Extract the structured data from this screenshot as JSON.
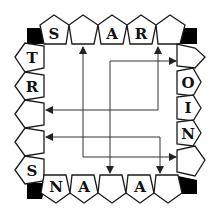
{
  "diagram": {
    "colors": {
      "stroke": "#1a1a1a",
      "corner_fill": "#000000",
      "arrow": "#222222",
      "background": "#ffffff"
    },
    "top_row": [
      {
        "letter": "S"
      },
      {
        "letter": ""
      },
      {
        "letter": "A"
      },
      {
        "letter": "R"
      },
      {
        "letter": ""
      }
    ],
    "left_column": [
      {
        "letter": "T"
      },
      {
        "letter": "R"
      },
      {
        "letter": ""
      },
      {
        "letter": ""
      },
      {
        "letter": "S"
      }
    ],
    "right_column": [
      {
        "letter": ""
      },
      {
        "letter": "O"
      },
      {
        "letter": "I"
      },
      {
        "letter": "N"
      },
      {
        "letter": ""
      }
    ],
    "bottom_row": [
      {
        "letter": "N"
      },
      {
        "letter": "A"
      },
      {
        "letter": ""
      },
      {
        "letter": "A"
      },
      {
        "letter": ""
      }
    ],
    "corners": [
      "top-left",
      "top-right",
      "bottom-left",
      "bottom-right"
    ],
    "arrows": [
      {
        "name": "arrow-1",
        "points": [
          [
            170,
            157
          ],
          [
            83,
            157
          ],
          [
            83,
            48
          ]
        ],
        "note": "right pentagon to top pentagon 2"
      },
      {
        "name": "arrow-2",
        "points": [
          [
            158,
            110
          ],
          [
            158,
            48
          ]
        ],
        "note": "up to top pentagon 5"
      },
      {
        "name": "arrow-3",
        "points": [
          [
            158,
            110
          ],
          [
            48,
            110
          ]
        ],
        "note": "left to left pentagon 3"
      },
      {
        "name": "arrow-4",
        "points": [
          [
            110,
            168
          ],
          [
            110,
            61
          ],
          [
            178,
            61
          ]
        ],
        "note": "right to right pentagon 1"
      },
      {
        "name": "arrow-5",
        "points": [
          [
            160,
            168
          ],
          [
            160,
            137
          ],
          [
            48,
            137
          ]
        ],
        "note": "left to left pentagon 4"
      },
      {
        "name": "arrow-6",
        "points": [
          [
            83,
            157
          ],
          [
            176,
            157
          ]
        ],
        "note": "right to right pentagon 5"
      }
    ]
  }
}
